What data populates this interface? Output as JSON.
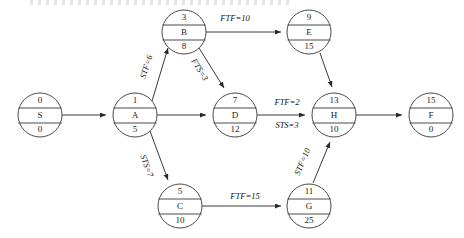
{
  "diagram": {
    "type": "activity-on-node-network",
    "stroke_color": "#3a3a3a",
    "node_fill": "#ffffff",
    "nodes": [
      {
        "id": "S",
        "label": "S",
        "top": "0",
        "bottom": "0",
        "cx": 40,
        "cy": 115,
        "r": 22
      },
      {
        "id": "A",
        "label": "A",
        "top": "1",
        "bottom": "5",
        "cx": 135,
        "cy": 115,
        "r": 22
      },
      {
        "id": "B",
        "label": "B",
        "top": "3",
        "bottom": "8",
        "cx": 184,
        "cy": 32,
        "r": 22
      },
      {
        "id": "D",
        "label": "D",
        "top": "7",
        "bottom": "12",
        "cx": 235,
        "cy": 115,
        "r": 22
      },
      {
        "id": "C",
        "label": "C",
        "top": "5",
        "bottom": "10",
        "cx": 180,
        "cy": 206,
        "r": 22
      },
      {
        "id": "E",
        "label": "E",
        "top": "9",
        "bottom": "15",
        "cx": 309,
        "cy": 32,
        "r": 22
      },
      {
        "id": "H",
        "label": "H",
        "top": "13",
        "bottom": "10",
        "cx": 334,
        "cy": 115,
        "r": 22
      },
      {
        "id": "G",
        "label": "G",
        "top": "11",
        "bottom": "25",
        "cx": 309,
        "cy": 206,
        "r": 22
      },
      {
        "id": "F",
        "label": "F",
        "top": "15",
        "bottom": "0",
        "cx": 431,
        "cy": 115,
        "r": 22
      }
    ],
    "edges": [
      {
        "id": "S-A",
        "from": "S",
        "to": "A",
        "label": "",
        "lx": 0,
        "ly": 0,
        "rotate": 0
      },
      {
        "id": "A-B",
        "from": "A",
        "to": "B",
        "label": "STF=6",
        "lx": 147,
        "ly": 67,
        "rotate": -60
      },
      {
        "id": "B-D",
        "from": "B",
        "to": "D",
        "label": "FTS=3",
        "lx": 196,
        "ly": 68,
        "rotate": 62
      },
      {
        "id": "A-D",
        "from": "A",
        "to": "D",
        "label": "",
        "lx": 0,
        "ly": 0,
        "rotate": 0
      },
      {
        "id": "A-C",
        "from": "A",
        "to": "C",
        "label": "STS=7",
        "lx": 146,
        "ly": 165,
        "rotate": 57
      },
      {
        "id": "B-E",
        "from": "B",
        "to": "E",
        "label": "FTF=10",
        "lx": 233,
        "ly": 19,
        "rotate": 0
      },
      {
        "id": "E-H",
        "from": "E",
        "to": "H",
        "label": "",
        "lx": 0,
        "ly": 0,
        "rotate": 0
      },
      {
        "id": "D-H",
        "from": "D",
        "to": "H",
        "label": "FTF=2",
        "lx": 287,
        "ly": 103,
        "rotate": 0
      },
      {
        "id": "D-H-2",
        "from": "D",
        "to": "H",
        "label": "STS=3",
        "lx": 287,
        "ly": 126,
        "rotate": 0
      },
      {
        "id": "C-G",
        "from": "C",
        "to": "G",
        "label": "FTF=15",
        "lx": 245,
        "ly": 197,
        "rotate": 0
      },
      {
        "id": "G-H",
        "from": "G",
        "to": "H",
        "label": "STF=10",
        "lx": 305,
        "ly": 161,
        "rotate": -60
      },
      {
        "id": "H-F",
        "from": "H",
        "to": "F",
        "label": "",
        "lx": 0,
        "ly": 0,
        "rotate": 0
      }
    ],
    "legend": {
      "node_top_meaning": "early start",
      "node_middle_meaning": "activity identifier",
      "node_bottom_meaning": "duration"
    }
  }
}
